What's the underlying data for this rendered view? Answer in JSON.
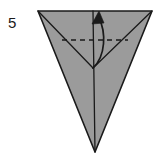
{
  "figure": {
    "step_label": "5",
    "background_color": "#ffffff",
    "paper_fill": "#9b9b9b",
    "outline_color": "#1a1a1a",
    "crease_color": "#1a1a1a",
    "arrow_color": "#1a1a1a",
    "outline_width": 1.6,
    "crease_width": 1.3,
    "dash_pattern": "5,4",
    "geometry": {
      "top_left": [
        38,
        11
      ],
      "top_right": [
        152,
        11
      ],
      "bottom_apex": [
        95,
        152
      ],
      "center_junction": [
        93,
        68
      ],
      "top_center": [
        93,
        11
      ],
      "dashed_fold_start": [
        62,
        40
      ],
      "dashed_fold_end": [
        128,
        40
      ],
      "arrow_tail": [
        93,
        68
      ],
      "arrow_head": [
        97,
        14
      ]
    },
    "elements": {
      "paper_outline_name": "paper-outline",
      "left_crease_name": "left-crease-line",
      "right_crease_name": "right-crease-line",
      "vertical_crease_name": "vertical-crease-line",
      "dashed_fold_name": "dashed-fold-line",
      "fold_arrow_name": "fold-arrow"
    }
  }
}
